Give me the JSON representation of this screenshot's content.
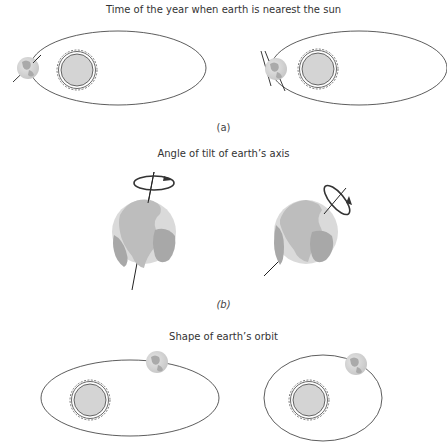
{
  "panels": [
    {
      "id": "a",
      "title": "Time of the year when earth is nearest the sun",
      "label": "(a)",
      "items": [
        {
          "name": "orbit-left",
          "shape": "ellipse",
          "cx": 118,
          "cy": 68,
          "rx": 88,
          "ry": 37,
          "sun": {
            "cx": 77,
            "cy": 70
          },
          "earth": {
            "cx": 28,
            "cy": 68,
            "axis_tilt_deg": 50
          }
        },
        {
          "name": "orbit-right",
          "shape": "ellipse",
          "cx": 359,
          "cy": 68,
          "rx": 88,
          "ry": 37,
          "sun": {
            "cx": 318,
            "cy": 69
          },
          "earth": {
            "cx": 276,
            "cy": 69,
            "axis_tilt_deg": -20
          }
        }
      ]
    },
    {
      "id": "b",
      "title": "Angle of tilt of earth’s axis",
      "label": "(b)",
      "items": [
        {
          "name": "globe-left",
          "cx": 144,
          "cy": 232,
          "r": 32,
          "axis_tilt_deg": 12
        },
        {
          "name": "globe-right",
          "cx": 306,
          "cy": 232,
          "r": 32,
          "axis_tilt_deg": 45
        }
      ]
    },
    {
      "id": "c",
      "title": "Shape of earth’s orbit",
      "label": "",
      "items": [
        {
          "name": "orbit-elongated",
          "shape": "ellipse",
          "cx": 130,
          "cy": 398,
          "rx": 89,
          "ry": 38,
          "sun": {
            "cx": 90,
            "cy": 399
          },
          "earth": {
            "cx": 157,
            "cy": 362
          }
        },
        {
          "name": "orbit-rounder",
          "shape": "ellipse",
          "cx": 357,
          "cy": 398,
          "rx": 59,
          "ry": 43,
          "sun": {
            "cx": 318,
            "cy": 399
          },
          "earth": {
            "cx": 356,
            "cy": 361
          }
        }
      ]
    }
  ],
  "colors": {
    "line": "#333333",
    "sun_fill": "#d4d4d4",
    "earth_land": "#a9a9a9",
    "earth_ocean": "#dcdcdc",
    "text": "#333333"
  }
}
